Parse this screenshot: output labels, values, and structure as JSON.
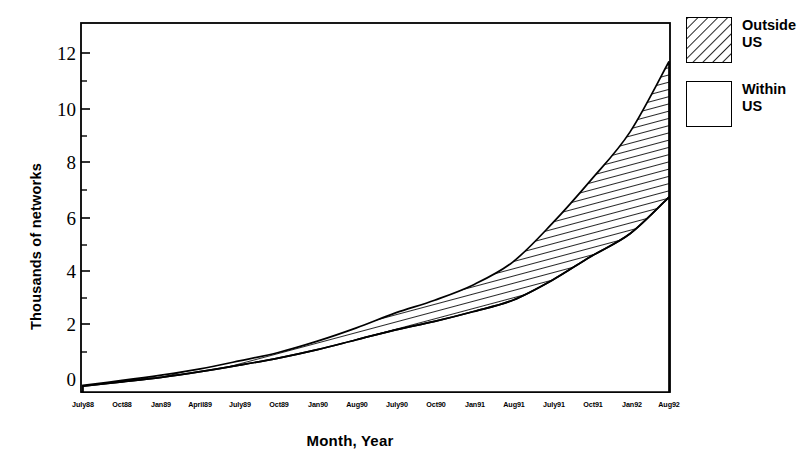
{
  "chart_data": {
    "type": "area",
    "title": "",
    "xlabel": "Month, Year",
    "ylabel": "Thousands of networks",
    "ylim": [
      0,
      12.9
    ],
    "yticks": [
      0,
      2,
      4,
      6,
      8,
      10,
      12
    ],
    "yticks_minor": [
      1,
      3,
      5,
      7,
      9,
      11
    ],
    "grid": false,
    "stacked": true,
    "legend_position": "right-top",
    "categories": [
      "July88",
      "Oct88",
      "Jan89",
      "April89",
      "July89",
      "Oct89",
      "Jan90",
      "Aug90",
      "July90",
      "Oct90",
      "Jan91",
      "Aug91",
      "July91",
      "Oct91",
      "Jan92",
      "Aug92"
    ],
    "series": [
      {
        "name": "Within US",
        "pattern": "solid-white",
        "values": [
          0.21,
          0.36,
          0.52,
          0.72,
          0.95,
          1.2,
          1.5,
          1.85,
          2.2,
          2.5,
          2.85,
          3.25,
          3.95,
          4.8,
          5.6,
          6.9
        ]
      },
      {
        "name": "Outside US",
        "pattern": "diagonal-hatch",
        "values": [
          0.03,
          0.05,
          0.08,
          0.1,
          0.15,
          0.2,
          0.3,
          0.42,
          0.6,
          0.75,
          0.95,
          1.35,
          2.0,
          2.7,
          3.6,
          4.8
        ]
      }
    ],
    "totals": [
      0.24,
      0.41,
      0.6,
      0.82,
      1.1,
      1.4,
      1.8,
      2.27,
      2.8,
      3.25,
      3.8,
      4.6,
      5.95,
      7.5,
      9.2,
      11.7
    ]
  },
  "legend": {
    "entries": [
      {
        "label": "Outside\nUS",
        "swatch": "hatched-swatch"
      },
      {
        "label": "Within\nUS",
        "swatch": "plain-swatch"
      }
    ]
  },
  "colors": {
    "stroke": "#000000",
    "background": "#ffffff",
    "hatch": "#000000"
  }
}
